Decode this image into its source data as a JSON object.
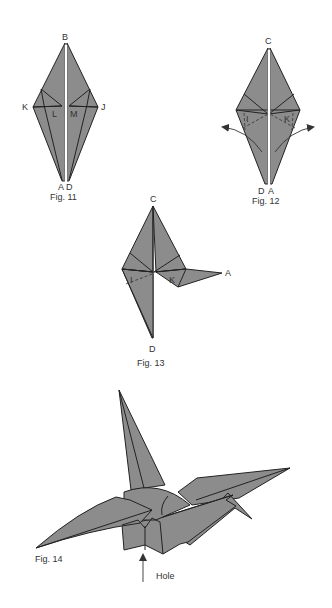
{
  "colors": {
    "background": "#ffffff",
    "paper": "#8c8c8c",
    "line": "#222222",
    "text": "#333333"
  },
  "figures": [
    {
      "id": "fig11",
      "caption": "Fig. 11",
      "labels": {
        "top": "B",
        "left": "K",
        "right": "J",
        "inner_left": "L",
        "inner_right": "M",
        "bottom_left": "A",
        "bottom_right": "D"
      }
    },
    {
      "id": "fig12",
      "caption": "Fig. 12",
      "labels": {
        "top": "C",
        "inner_left": "I",
        "inner_right": "K",
        "bottom_left": "D",
        "bottom_right": "A"
      }
    },
    {
      "id": "fig13",
      "caption": "Fig. 13",
      "labels": {
        "top": "C",
        "inner_left": "I",
        "inner_right": "K",
        "right_point": "A",
        "bottom": "D"
      }
    },
    {
      "id": "fig14",
      "caption": "Fig. 14",
      "annotation": "Hole"
    }
  ]
}
